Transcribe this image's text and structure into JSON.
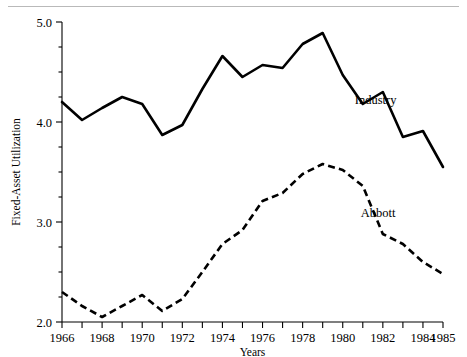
{
  "chart_data": {
    "type": "line",
    "title": "",
    "xlabel": "Years",
    "ylabel": "Fixed-Asset Utilization",
    "xlim": [
      1966,
      1985
    ],
    "ylim": [
      2.0,
      5.0
    ],
    "grid": false,
    "legend_position": "inline-annotation",
    "y_ticks": [
      "2.0",
      "3.0",
      "4.0",
      "5.0"
    ],
    "y_tick_values": [
      2.0,
      3.0,
      4.0,
      5.0
    ],
    "y_minor_step": 0.25,
    "x_ticks": [
      "1966",
      "1968",
      "1970",
      "1972",
      "1974",
      "1976",
      "1978",
      "1980",
      "1982",
      "1984",
      "1985"
    ],
    "x_tick_values": [
      1966,
      1968,
      1970,
      1972,
      1974,
      1976,
      1978,
      1980,
      1982,
      1984,
      1985
    ],
    "x": [
      1966,
      1967,
      1968,
      1969,
      1970,
      1971,
      1972,
      1973,
      1974,
      1975,
      1976,
      1977,
      1978,
      1979,
      1980,
      1981,
      1982,
      1983,
      1984,
      1985
    ],
    "series": [
      {
        "name": "Industry",
        "style": "solid",
        "color": "#000000",
        "label_x": 1980.6,
        "label_y": 4.18,
        "values": [
          4.2,
          4.02,
          4.14,
          4.25,
          4.18,
          3.87,
          3.97,
          4.33,
          4.66,
          4.45,
          4.57,
          4.54,
          4.78,
          4.89,
          4.47,
          4.18,
          4.3,
          3.85,
          3.91,
          3.55
        ]
      },
      {
        "name": "Abbott",
        "style": "dashed",
        "color": "#000000",
        "label_x": 1980.9,
        "label_y": 3.05,
        "values": [
          2.3,
          2.16,
          2.05,
          2.16,
          2.27,
          2.11,
          2.23,
          2.5,
          2.78,
          2.92,
          3.21,
          3.29,
          3.48,
          3.58,
          3.52,
          3.36,
          2.88,
          2.78,
          2.6,
          2.48
        ]
      }
    ]
  },
  "axes": {
    "y_title": "Fixed-Asset Utilization",
    "x_title": "Years"
  }
}
